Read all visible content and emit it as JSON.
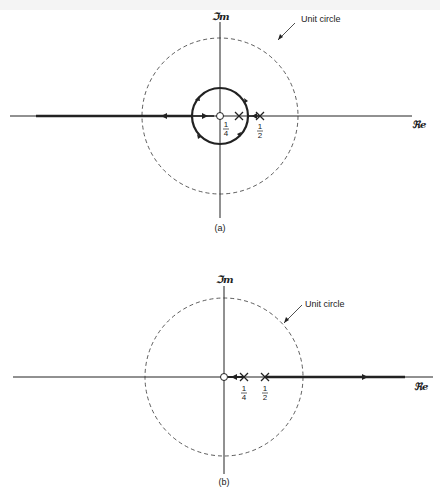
{
  "figures": [
    {
      "id": "a",
      "caption": "(a)",
      "axes": {
        "real_label": "ℜe",
        "imag_label": "ℑm"
      },
      "unit_circle_label": "Unit circle",
      "poles": [
        {
          "value": "1/4",
          "num": "1",
          "den": "4"
        },
        {
          "value": "1/2",
          "num": "1",
          "den": "2"
        }
      ],
      "zeros": [
        {
          "value": "0"
        }
      ],
      "locus": "circle of radius ~1/3 centered at origin plus negative real axis to -∞"
    },
    {
      "id": "b",
      "caption": "(b)",
      "axes": {
        "real_label": "ℜe",
        "imag_label": "ℑm"
      },
      "unit_circle_label": "Unit circle",
      "poles": [
        {
          "value": "1/4",
          "num": "1",
          "den": "4"
        },
        {
          "value": "1/2",
          "num": "1",
          "den": "2"
        }
      ],
      "zeros": [
        {
          "value": "0"
        }
      ],
      "locus": "segment from 1/4 to 0 and from 1/2 to +∞ on real axis"
    }
  ],
  "colors": {
    "ink": "#222222",
    "background": "#ffffff"
  }
}
